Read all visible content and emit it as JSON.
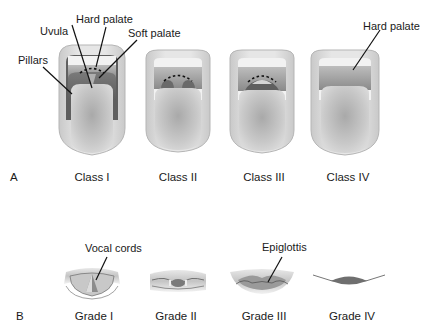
{
  "figure": {
    "panel_a": {
      "letter": "A",
      "title": "Mallampati classification",
      "classes": [
        {
          "label": "Class  I"
        },
        {
          "label": "Class  II"
        },
        {
          "label": "Class  III"
        },
        {
          "label": "Class  IV"
        }
      ],
      "annotations": {
        "hard_palate": "Hard palate",
        "uvula": "Uvula",
        "soft_palate": "Soft palate",
        "pillars": "Pillars",
        "hard_palate_iv": "Hard palate"
      }
    },
    "panel_b": {
      "letter": "B",
      "title": "Cormack-Lehane grades",
      "grades": [
        {
          "label": "Grade I"
        },
        {
          "label": "Grade II"
        },
        {
          "label": "Grade III"
        },
        {
          "label": "Grade IV"
        }
      ],
      "annotations": {
        "vocal_cords": "Vocal cords",
        "epiglottis": "Epiglottis"
      }
    },
    "colors": {
      "lip": "#d6d6d6",
      "lip_edge": "#b8b8b8",
      "teeth": "#f4f4f4",
      "palate": "#8f8f8f",
      "throat": "#6e6e6e",
      "tongue": "#c4c4c4",
      "leader_line": "#111111"
    }
  }
}
